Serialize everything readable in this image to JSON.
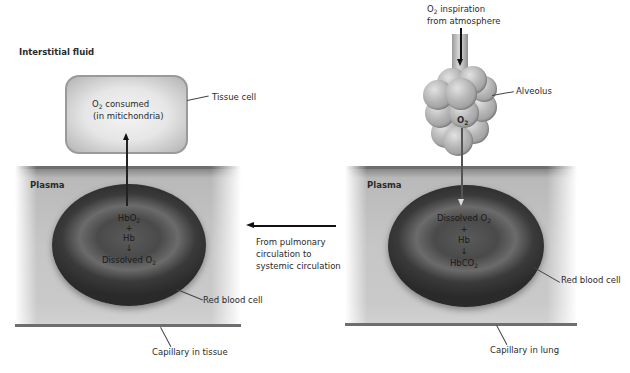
{
  "diagram": {
    "left": {
      "region_label": "Interstitial fluid",
      "tissue_cell": {
        "line1_prefix": "O",
        "line1_sub": "2",
        "line1_suffix": " consumed",
        "line2": "(in mitichondria)",
        "callout": "Tissue cell"
      },
      "plasma_label": "Plasma",
      "rbc": {
        "line1_prefix": "HbO",
        "line1_sub": "2",
        "line2": "+",
        "line3": "Hb",
        "line4": "↓",
        "line5_prefix": "Dissolved O",
        "line5_sub": "2",
        "callout": "Red blood cell"
      },
      "capillary_callout": "Capillary in tissue"
    },
    "middle": {
      "flow_label_line1": "From pulmonary",
      "flow_label_line2": "circulation to",
      "flow_label_line3": "systemic circulation"
    },
    "right": {
      "inspiration_line1_prefix": "O",
      "inspiration_line1_sub": "2",
      "inspiration_line1_suffix": " inspiration",
      "inspiration_line2": "from atmosphere",
      "alveolus_callout": "Alveolus",
      "alveolus_o2_prefix": "O",
      "alveolus_o2_sub": "2",
      "plasma_label": "Plasma",
      "rbc": {
        "line1_prefix": "Dissolved O",
        "line1_sub": "2",
        "line2": "+",
        "line3": "Hb",
        "line4": "↓",
        "line5_prefix": "HbCO",
        "line5_sub": "2",
        "callout": "Red blood cell"
      },
      "capillary_callout": "Capillary in lung"
    },
    "colors": {
      "arrow": "#111111",
      "capillary_wall": "#6e6e6e",
      "plasma": "#c6c6c6",
      "rbc_dark": "#2a2a2a",
      "text": "#2a2a2a"
    }
  }
}
